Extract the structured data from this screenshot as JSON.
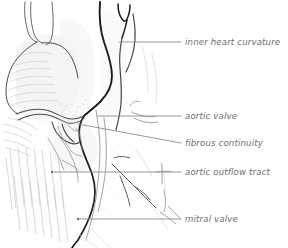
{
  "figure": {
    "name": "cardiac-anatomy-line-drawing",
    "width": 288,
    "height": 248,
    "background_color": "#ffffff",
    "style": "pen-and-ink anatomical illustration, grayscale"
  },
  "colors": {
    "background": "#ffffff",
    "label_text": "#6e6e72",
    "leader_line": "#8a8a8f",
    "ink_heavy": "#1c1c1c",
    "ink_mid": "#4a4a4c",
    "ink_light": "#9a9a9e",
    "ink_faint": "#c2c2c6",
    "tissue_wash": "#f4f3f2"
  },
  "labels": [
    {
      "id": "inner-heart-curvature",
      "text": "inner heart curvature",
      "text_x": 185,
      "text_y": 45,
      "leader": {
        "x1": 119,
        "y1": 42,
        "x2": 181,
        "y2": 42
      },
      "anchor_marker": "none"
    },
    {
      "id": "aortic-valve",
      "text": "aortic valve",
      "text_x": 185,
      "text_y": 119,
      "leader": {
        "x1": 97,
        "y1": 116,
        "x2": 181,
        "y2": 116
      },
      "anchor_marker": "none"
    },
    {
      "id": "fibrous-continuity",
      "text": "fibrous continuity",
      "text_x": 185,
      "text_y": 146,
      "leader": {
        "x1": 78,
        "y1": 124,
        "x2": 181,
        "y2": 143
      },
      "anchor_marker": "none"
    },
    {
      "id": "aortic-outflow-tract",
      "text": "aortic outflow tract",
      "text_x": 185,
      "text_y": 175,
      "leader": {
        "x1": 52,
        "y1": 172,
        "x2": 181,
        "y2": 172
      },
      "anchor_marker": "dot"
    },
    {
      "id": "mitral-valve",
      "text": "mitral valve",
      "text_x": 185,
      "text_y": 222,
      "leader": {
        "x1": 78,
        "y1": 219,
        "x2": 181,
        "y2": 219
      },
      "anchor_marker": "dot"
    }
  ],
  "structures": [
    {
      "id": "great-vessel-upper-left",
      "description": "paired thin vessel walls descending from top edge"
    },
    {
      "id": "atrial-lobe",
      "description": "rounded shaded lobe on left with fine hatching"
    },
    {
      "id": "inner-curvature-ridge",
      "description": "heavy dark curve descending through center"
    },
    {
      "id": "vessel-bifurcation",
      "description": "V-shaped branch near top center"
    },
    {
      "id": "valve-cusp-region",
      "description": "scalloped valve leaflets at mid-height"
    },
    {
      "id": "myocardial-striations",
      "description": "parallel vertical muscle fiber lines lower left"
    },
    {
      "id": "outflow-tract-channel",
      "description": "vertical channel right of center with stippled texture"
    },
    {
      "id": "chordae-strands",
      "description": "thin diagonal strands in lower right of drawing"
    }
  ]
}
